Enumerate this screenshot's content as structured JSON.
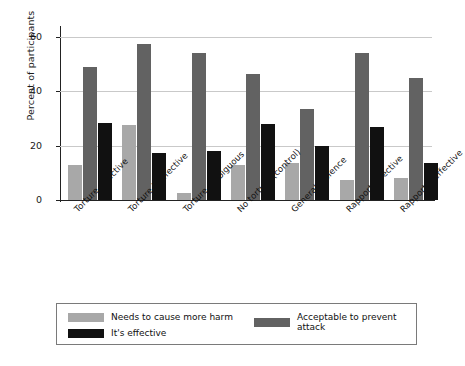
{
  "chart_data": {
    "type": "bar",
    "title": "",
    "xlabel": "",
    "ylabel": "Percent of participants",
    "ylim": [
      0,
      63
    ],
    "yticks": [
      0,
      20,
      40,
      60
    ],
    "ytick_labels": [
      "0",
      "20",
      "40",
      "60"
    ],
    "grid": "horizontal",
    "legend_position": "bottom",
    "categories": [
      "Torture effective",
      "Torture ineffective",
      "Torture ambiguous",
      "No torture (control)",
      "General violence",
      "Rapport effective",
      "Rapport ineffective"
    ],
    "series": [
      {
        "name": "Needs to cause more harm",
        "color": "#a8a8a8",
        "values": [
          13,
          27.5,
          2.5,
          13,
          13.5,
          7.5,
          8
        ]
      },
      {
        "name": "Acceptable to prevent attack",
        "color": "#626262",
        "values": [
          49,
          57.5,
          54,
          46.5,
          33.5,
          54,
          45
        ]
      },
      {
        "name": "It's effective",
        "color": "#111111",
        "values": [
          28.5,
          17.5,
          18,
          28,
          20,
          27,
          13.5
        ]
      }
    ]
  },
  "legend": {
    "items": [
      {
        "label": "Needs to cause more harm",
        "color": "#a8a8a8"
      },
      {
        "label": "Acceptable to prevent attack",
        "color": "#626262"
      },
      {
        "label": "It's effective",
        "color": "#111111"
      }
    ]
  }
}
